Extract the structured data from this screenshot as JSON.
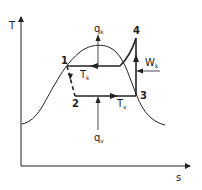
{
  "axes": {
    "y_label": "T",
    "x_label": "s"
  },
  "points": [
    {
      "id": "1",
      "label": "1"
    },
    {
      "id": "2",
      "label": "2"
    },
    {
      "id": "3",
      "label": "3"
    },
    {
      "id": "4",
      "label": "4"
    }
  ],
  "labels": {
    "qk_main": "q",
    "qk_sub": "k",
    "qv_main": "q",
    "qv_sub": "v",
    "Tk_main": "T",
    "Tk_sub": "k",
    "Tv_main": "T",
    "Tv_sub": "v",
    "Wk_main": "W",
    "Wk_sub": "k"
  },
  "colors": {
    "line": "#222222",
    "background": "#ffffff"
  }
}
